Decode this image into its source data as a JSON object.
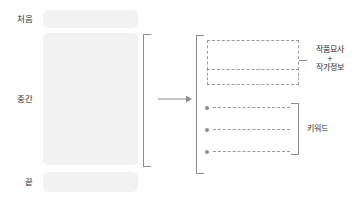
{
  "diagram": {
    "colors": {
      "block_fill": "#f2f2f2",
      "line": "#8c8c8c",
      "dash": "#9a9a9a",
      "text": "#2f2f2f",
      "background": "#ffffff"
    },
    "left_panel": {
      "name": "source-text-structure",
      "stages": [
        {
          "label": "처음",
          "block_name": "beginning-block"
        },
        {
          "label": "중간",
          "block_name": "middle-block"
        },
        {
          "label": "끝",
          "block_name": "end-block"
        }
      ],
      "bracket_label": ""
    },
    "arrow": {
      "glyph": "→",
      "label": ""
    },
    "right_panel": {
      "name": "extracted-metadata",
      "groups": [
        {
          "name": "description-group",
          "label_lines": [
            "작품묘사",
            "+",
            "작가정보"
          ],
          "rows": 2
        },
        {
          "name": "keyword-group",
          "label_lines": [
            "키워드"
          ],
          "bullets": [
            "",
            "",
            ""
          ]
        }
      ]
    }
  }
}
